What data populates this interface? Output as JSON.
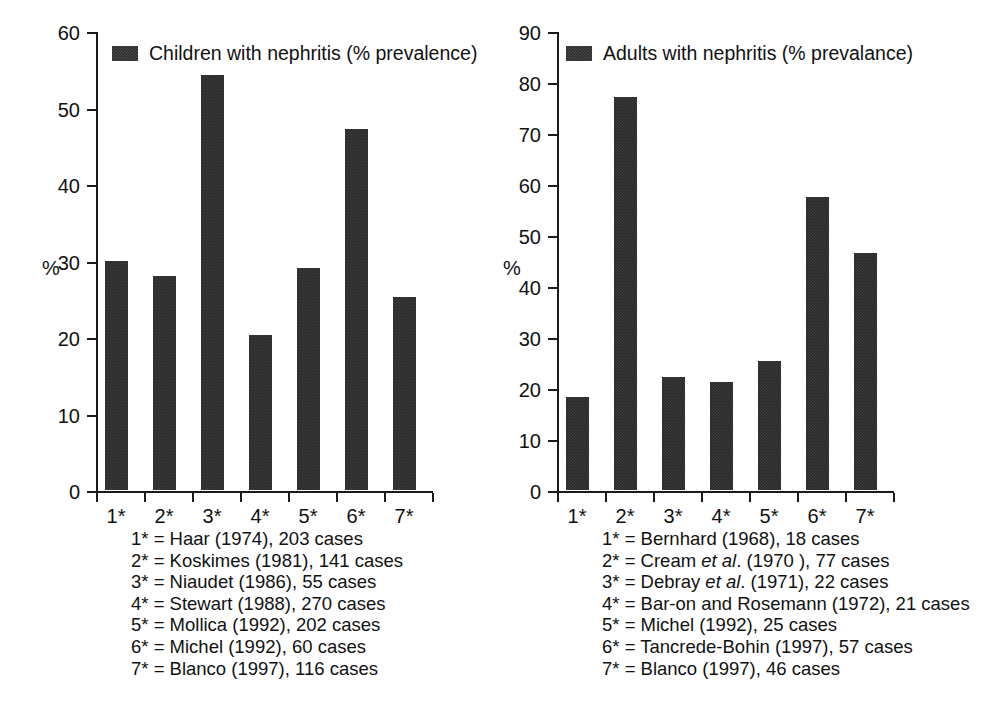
{
  "chart_data": [
    {
      "id": "children",
      "type": "bar",
      "title": "",
      "legend_label": "Children with nephritis (% prevalence)",
      "legend_position": "inside-top-left",
      "xlabel": "",
      "ylabel": "%",
      "ylim": [
        0,
        60
      ],
      "ytick_values": [
        0,
        10,
        20,
        30,
        40,
        50,
        60
      ],
      "ytick_labels": [
        "0",
        "10",
        "20",
        "30",
        "40",
        "50",
        "60"
      ],
      "grid": false,
      "categories": [
        "1*",
        "2*",
        "3*",
        "4*",
        "5*",
        "6*",
        "7*"
      ],
      "values": [
        30.0,
        28.0,
        54.2,
        20.2,
        29.0,
        47.2,
        25.2
      ],
      "footnotes": [
        {
          "key": "1*",
          "prefix": "1* = Haar (1974), 203 cases",
          "italic": "",
          "suffix": ""
        },
        {
          "key": "2*",
          "prefix": "2* = Koskimes (1981), 141 cases",
          "italic": "",
          "suffix": ""
        },
        {
          "key": "3*",
          "prefix": "3* = Niaudet (1986), 55 cases",
          "italic": "",
          "suffix": ""
        },
        {
          "key": "4*",
          "prefix": "4* = Stewart (1988), 270 cases",
          "italic": "",
          "suffix": ""
        },
        {
          "key": "5*",
          "prefix": "5* = Mollica (1992), 202 cases",
          "italic": "",
          "suffix": ""
        },
        {
          "key": "6*",
          "prefix": "6* = Michel (1992), 60 cases",
          "italic": "",
          "suffix": ""
        },
        {
          "key": "7*",
          "prefix": "7* = Blanco (1997), 116 cases",
          "italic": "",
          "suffix": ""
        }
      ]
    },
    {
      "id": "adults",
      "type": "bar",
      "title": "",
      "legend_label": "Adults with nephritis (% prevalance)",
      "legend_position": "inside-top-left",
      "xlabel": "",
      "ylabel": "%",
      "ylim": [
        0,
        90
      ],
      "ytick_values": [
        0,
        10,
        20,
        30,
        40,
        50,
        60,
        70,
        80,
        90
      ],
      "ytick_labels": [
        "0",
        "10",
        "20",
        "30",
        "40",
        "50",
        "60",
        "70",
        "80",
        "90"
      ],
      "grid": false,
      "categories": [
        "1*",
        "2*",
        "3*",
        "4*",
        "5*",
        "6*",
        "7*"
      ],
      "values": [
        18.3,
        77.0,
        22.2,
        21.2,
        25.2,
        57.5,
        46.4
      ],
      "footnotes": [
        {
          "key": "1*",
          "prefix": "1* = Bernhard (1968), 18 cases",
          "italic": "",
          "suffix": ""
        },
        {
          "key": "2*",
          "prefix": "2* = Cream ",
          "italic": "et al",
          "suffix": ". (1970 ), 77 cases"
        },
        {
          "key": "3*",
          "prefix": "3* = Debray ",
          "italic": "et al",
          "suffix": ". (1971), 22 cases"
        },
        {
          "key": "4*",
          "prefix": "4* = Bar-on and Rosemann (1972), 21 cases",
          "italic": "",
          "suffix": ""
        },
        {
          "key": "5*",
          "prefix": "5* = Michel (1992), 25 cases",
          "italic": "",
          "suffix": ""
        },
        {
          "key": "6*",
          "prefix": "6* = Tancrede-Bohin (1997), 57 cases",
          "italic": "",
          "suffix": ""
        },
        {
          "key": "7*",
          "prefix": "7* = Blanco (1997), 46 cases",
          "italic": "",
          "suffix": ""
        }
      ]
    }
  ],
  "colors": {
    "bar": "#2b2b2b",
    "axis": "#1b1b1b",
    "text": "#111111",
    "background": "#ffffff"
  }
}
